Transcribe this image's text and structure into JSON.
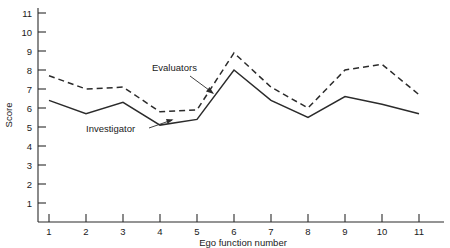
{
  "chart_data": {
    "type": "line",
    "title": "",
    "xlabel": "Ego function number",
    "ylabel": "Score",
    "x": [
      1,
      2,
      3,
      4,
      5,
      6,
      7,
      8,
      9,
      10,
      11
    ],
    "xticklabels": [
      "1",
      "2",
      "3",
      "4",
      "5",
      "6",
      "7",
      "8",
      "9",
      "10",
      "11"
    ],
    "yticklabels": [
      "1",
      "2",
      "3",
      "4",
      "5",
      "6",
      "7",
      "8",
      "9",
      "10",
      "11"
    ],
    "yticks": [
      1,
      2,
      3,
      4,
      5,
      6,
      7,
      8,
      9,
      10,
      11
    ],
    "xlim": [
      0.55,
      11.45
    ],
    "ylim": [
      0,
      11.6
    ],
    "grid": false,
    "legend_position": "inline-annotations",
    "series": [
      {
        "name": "Evaluators",
        "style": "dashed",
        "color": "#2b2b2b",
        "values": [
          7.7,
          7.0,
          7.1,
          5.8,
          5.9,
          8.9,
          7.1,
          6.0,
          8.0,
          8.3,
          6.7
        ]
      },
      {
        "name": "Investigator",
        "style": "solid",
        "color": "#2b2b2b",
        "values": [
          6.4,
          5.7,
          6.3,
          5.1,
          5.4,
          8.0,
          6.4,
          5.5,
          6.6,
          6.2,
          5.7
        ]
      }
    ],
    "annotations": [
      {
        "text": "Evaluators",
        "target_x": 6.0,
        "target_y": 7.5
      },
      {
        "text": "Investigator",
        "target_x": 4.6,
        "target_y": 5.3
      }
    ]
  },
  "axes": {
    "y_title": "Score",
    "x_title": "Ego function number"
  }
}
